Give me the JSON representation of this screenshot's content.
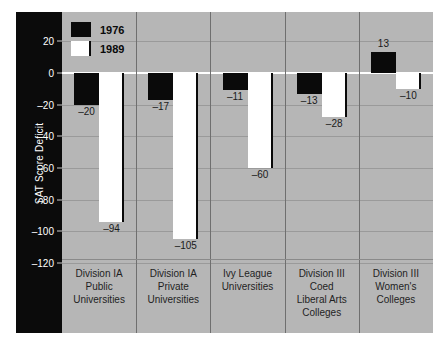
{
  "chart_data": {
    "type": "bar",
    "title": "",
    "xlabel": "",
    "ylabel": "SAT Score Deficit",
    "ylim": [
      -130,
      30
    ],
    "grid": true,
    "legend_position": "top-left",
    "categories": [
      "Division IA\nPublic\nUniversities",
      "Division IA\nPrivate\nUniversities",
      "Ivy League\nUniversities",
      "Division III\nCoed\nLiberal Arts\nColleges",
      "Division III\nWomen's\nColleges"
    ],
    "yticks": [
      20,
      0,
      -20,
      -40,
      -60,
      -80,
      -100,
      -120
    ],
    "ytick_labels": [
      "20",
      "0",
      "–20",
      "–40",
      "–60",
      "–80",
      "–100",
      "–120"
    ],
    "series": [
      {
        "name": "1976",
        "color": "#0a0a0a",
        "values": [
          -20,
          -17,
          -11,
          -13,
          13
        ],
        "labels": [
          "–20",
          "–17",
          "–11",
          "–13",
          "13"
        ]
      },
      {
        "name": "1989",
        "color": "#ffffff",
        "values": [
          -94,
          -105,
          -60,
          -28,
          -10
        ],
        "labels": [
          "–94",
          "–105",
          "–60",
          "–28",
          "–10"
        ]
      }
    ]
  },
  "legend": {
    "items": [
      {
        "label": "1976",
        "swatch": "black-square-swatch"
      },
      {
        "label": "1989",
        "swatch": "white-square-swatch"
      }
    ]
  },
  "axis": {
    "y_title": "SAT Score Deficit"
  }
}
